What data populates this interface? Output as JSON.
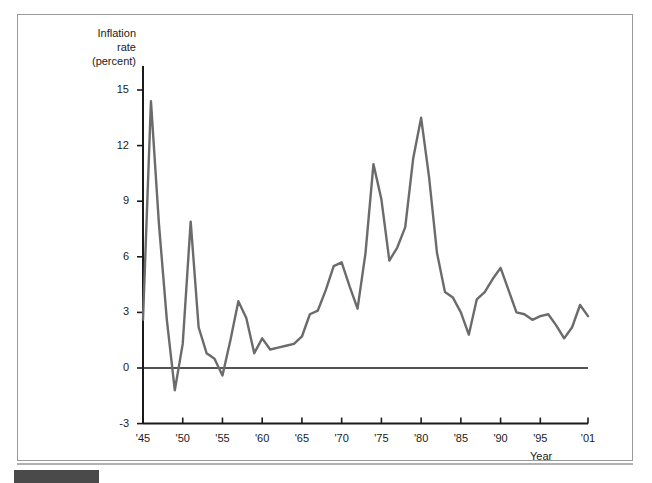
{
  "figure": {
    "y_axis_title": "Inflation\nrate\n(percent)",
    "x_axis_title": "Year",
    "line_color": "#6b6b6b",
    "axis_color": "#1a1a1a",
    "frame_color": "#9a9a9a",
    "footer_bar_color": "#4a4a4a"
  },
  "chart_data": {
    "type": "line",
    "title": "",
    "subtitle": "",
    "xlabel": "Year",
    "ylabel": "Inflation rate (percent)",
    "xlim": [
      1945,
      2001
    ],
    "ylim": [
      -3,
      16.5
    ],
    "yticks": [
      15,
      12,
      9,
      6,
      3,
      0,
      -3
    ],
    "ytick_labels": [
      "15",
      "12",
      "9",
      "6",
      "3",
      "0",
      "-3"
    ],
    "xticks": [
      1945,
      1950,
      1955,
      1960,
      1965,
      1970,
      1975,
      1980,
      1985,
      1990,
      1995,
      2001
    ],
    "xtick_labels": [
      "'45",
      "'50",
      "'55",
      "'60",
      "'65",
      "'70",
      "'75",
      "'80",
      "'85",
      "'90",
      "'95",
      "'01"
    ],
    "grid": false,
    "legend": null,
    "legend_position": "none",
    "zero_line": 0,
    "series": [
      {
        "name": "Inflation rate (percent)",
        "color": "#6b6b6b",
        "x": [
          1945,
          1946,
          1947,
          1948,
          1949,
          1950,
          1951,
          1952,
          1953,
          1954,
          1955,
          1956,
          1957,
          1958,
          1959,
          1960,
          1961,
          1962,
          1963,
          1964,
          1965,
          1966,
          1967,
          1968,
          1969,
          1970,
          1971,
          1972,
          1973,
          1974,
          1975,
          1976,
          1977,
          1978,
          1979,
          1980,
          1981,
          1982,
          1983,
          1984,
          1985,
          1986,
          1987,
          1988,
          1989,
          1990,
          1991,
          1992,
          1993,
          1994,
          1995,
          1996,
          1997,
          1998,
          1999,
          2000,
          2001
        ],
        "values": [
          2.6,
          14.4,
          7.8,
          2.6,
          -1.2,
          1.3,
          7.9,
          2.2,
          0.8,
          0.5,
          -0.4,
          1.5,
          3.6,
          2.7,
          0.8,
          1.6,
          1.0,
          1.1,
          1.2,
          1.3,
          1.7,
          2.9,
          3.1,
          4.2,
          5.5,
          5.7,
          4.4,
          3.2,
          6.2,
          11.0,
          9.1,
          5.8,
          6.5,
          7.6,
          11.3,
          13.5,
          10.3,
          6.2,
          4.1,
          3.8,
          3.0,
          1.8,
          3.7,
          4.1,
          4.8,
          5.4,
          4.2,
          3.0,
          2.9,
          2.6,
          2.8,
          2.9,
          2.3,
          1.6,
          2.2,
          3.4,
          2.8
        ]
      }
    ]
  }
}
